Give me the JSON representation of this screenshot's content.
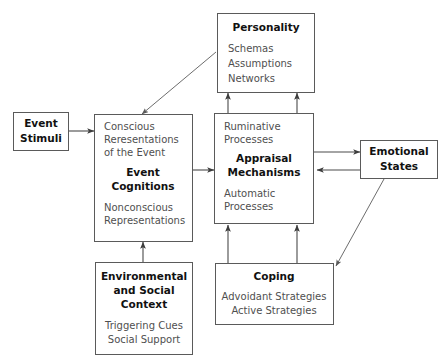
{
  "figure": {
    "kind": "flow-diagram",
    "background_color": "#ffffff",
    "box_border_color": "#5a5a5a",
    "arrow_color": "#4a4a4a",
    "title_text_color": "#111111",
    "body_text_color": "#4f4f4f"
  },
  "nodes": {
    "personality": {
      "title": "Personality",
      "line1": "Schemas",
      "line2": "Assumptions",
      "line3": "Networks"
    },
    "event_stimuli": {
      "line1": "Event",
      "line2": "Stimuli"
    },
    "event_cognitions": {
      "top1": "Conscious",
      "top2": "Reresentations",
      "top3": "of the Event",
      "title1": "Event",
      "title2": "Cognitions",
      "bottom1": "Nonconscious",
      "bottom2": "Representations"
    },
    "appraisal": {
      "top1": "Ruminative",
      "top2": "Processes",
      "title1": "Appraisal",
      "title2": "Mechanisms",
      "bottom1": "Automatic",
      "bottom2": "Processes"
    },
    "emotional_states": {
      "line1": "Emotional",
      "line2": "States"
    },
    "environmental": {
      "title1": "Environmental",
      "title2": "and Social",
      "title3": "Context",
      "body1": "Triggering Cues",
      "body2": "Social Support"
    },
    "coping": {
      "title": "Coping",
      "body1": "Advoidant Strategies",
      "body2": "Active Strategies"
    }
  },
  "edges": [
    {
      "id": "stimuli-to-cognitions",
      "from": "event_stimuli",
      "to": "event_cognitions",
      "direction": "one-way"
    },
    {
      "id": "cognitions-to-appraisal",
      "from": "event_cognitions",
      "to": "appraisal",
      "direction": "one-way"
    },
    {
      "id": "personality-to-cognitions",
      "from": "personality",
      "to": "event_cognitions",
      "direction": "one-way"
    },
    {
      "id": "appraisal-to-personality-left",
      "from": "appraisal",
      "to": "personality",
      "direction": "one-way"
    },
    {
      "id": "appraisal-to-personality-right",
      "from": "appraisal",
      "to": "personality",
      "direction": "one-way"
    },
    {
      "id": "appraisal-to-emotional",
      "from": "appraisal",
      "to": "emotional_states",
      "direction": "one-way"
    },
    {
      "id": "emotional-to-appraisal",
      "from": "emotional_states",
      "to": "appraisal",
      "direction": "one-way"
    },
    {
      "id": "emotional-to-coping",
      "from": "emotional_states",
      "to": "coping",
      "direction": "one-way"
    },
    {
      "id": "coping-to-appraisal-left",
      "from": "coping",
      "to": "appraisal",
      "direction": "one-way"
    },
    {
      "id": "coping-to-appraisal-right",
      "from": "coping",
      "to": "appraisal",
      "direction": "one-way"
    },
    {
      "id": "environmental-to-cognitions",
      "from": "environmental",
      "to": "event_cognitions",
      "direction": "one-way"
    }
  ]
}
